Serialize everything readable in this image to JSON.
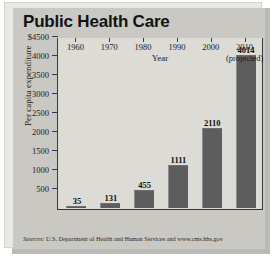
{
  "chart_data": {
    "type": "bar",
    "title": "Public Health Care",
    "xlabel": "Year",
    "ylabel": "Per capita expenditure",
    "categories": [
      "1960",
      "1970",
      "1980",
      "1990",
      "2000",
      "2010"
    ],
    "category_sublabels": [
      "",
      "",
      "",
      "",
      "",
      "(projected)"
    ],
    "values": [
      35,
      131,
      455,
      1111,
      2110,
      4014
    ],
    "value_labels": [
      "35",
      "131",
      "455",
      "1111",
      "2110",
      "4014"
    ],
    "ylim": [
      0,
      4500
    ],
    "ytick_labels": [
      "$4500",
      "4000",
      "3500",
      "3000",
      "2500",
      "2000",
      "1500",
      "1000",
      "500"
    ],
    "ytick_values": [
      4500,
      4000,
      3500,
      3000,
      2500,
      2000,
      1500,
      1000,
      500
    ],
    "grid": false,
    "legend": false,
    "bar_color": "#5d5d5d",
    "plot_background": "#dcdbd6",
    "panel_background": "#c9c8c3",
    "axis_color": "#3a3a3a"
  },
  "source": {
    "prefix": "Sources:",
    "text": " U.S. Department of Health and Human Services and www.cms.hhs.gov"
  }
}
